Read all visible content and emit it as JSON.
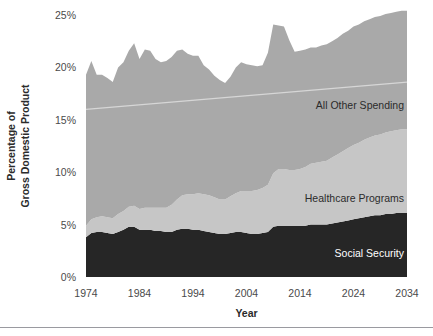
{
  "axes": {
    "y_title_line1": "Percentage of",
    "y_title_line2": "Gross Domestic Product",
    "x_title": "Year",
    "y_ticks": [
      "25%",
      "20%",
      "15%",
      "10%",
      "5%",
      "0%"
    ],
    "x_ticks": [
      "1974",
      "1984",
      "1994",
      "2004",
      "2014",
      "2024",
      "2034"
    ]
  },
  "series_labels": {
    "all_other": "All Other Spending",
    "healthcare": "Healthcare Programs",
    "social_security": "Social Security"
  },
  "colors": {
    "all_other": "#a9a9a9",
    "healthcare": "#c6c6c6",
    "social_security": "#262626",
    "average_line": "#d6d6d6",
    "label_dark": "#2b2b2b",
    "label_light": "#ffffff",
    "tick_text": "#4a4a4a",
    "rule": "#9a9aa0",
    "background": "#ffffff"
  },
  "chart_data": {
    "type": "area",
    "stacked": true,
    "title": "",
    "xlabel": "Year",
    "ylabel": "Percentage of Gross Domestic Product",
    "xlim": [
      1974,
      2034
    ],
    "ylim": [
      0,
      25
    ],
    "ytick_values": [
      0,
      5,
      10,
      15,
      20,
      25
    ],
    "xtick_values": [
      1974,
      1984,
      1994,
      2004,
      2014,
      2024,
      2034
    ],
    "grid": false,
    "legend": "inline-labels",
    "units": "percent of GDP",
    "x": [
      1974,
      1975,
      1976,
      1977,
      1978,
      1979,
      1980,
      1981,
      1982,
      1983,
      1984,
      1985,
      1986,
      1987,
      1988,
      1989,
      1990,
      1991,
      1992,
      1993,
      1994,
      1995,
      1996,
      1997,
      1998,
      1999,
      2000,
      2001,
      2002,
      2003,
      2004,
      2005,
      2006,
      2007,
      2008,
      2009,
      2010,
      2011,
      2012,
      2013,
      2014,
      2015,
      2016,
      2017,
      2018,
      2019,
      2020,
      2021,
      2022,
      2023,
      2024,
      2025,
      2026,
      2027,
      2028,
      2029,
      2030,
      2031,
      2032,
      2033,
      2034
    ],
    "series": [
      {
        "name": "Social Security",
        "color": "#262626",
        "values": [
          3.8,
          4.2,
          4.3,
          4.3,
          4.2,
          4.1,
          4.3,
          4.5,
          4.8,
          4.8,
          4.5,
          4.5,
          4.5,
          4.4,
          4.4,
          4.3,
          4.3,
          4.5,
          4.6,
          4.6,
          4.5,
          4.5,
          4.4,
          4.3,
          4.2,
          4.1,
          4.1,
          4.2,
          4.3,
          4.3,
          4.2,
          4.1,
          4.1,
          4.2,
          4.3,
          4.8,
          4.9,
          4.9,
          4.9,
          4.9,
          4.9,
          4.9,
          5.0,
          5.0,
          5.0,
          5.0,
          5.1,
          5.2,
          5.3,
          5.4,
          5.5,
          5.6,
          5.7,
          5.8,
          5.9,
          5.9,
          6.0,
          6.0,
          6.1,
          6.1,
          6.1
        ]
      },
      {
        "name": "Healthcare Programs",
        "color": "#c6c6c6",
        "values": [
          1.1,
          1.3,
          1.4,
          1.5,
          1.5,
          1.5,
          1.7,
          1.8,
          1.9,
          2.0,
          2.0,
          2.1,
          2.1,
          2.2,
          2.2,
          2.3,
          2.6,
          2.9,
          3.2,
          3.3,
          3.4,
          3.5,
          3.5,
          3.5,
          3.4,
          3.3,
          3.3,
          3.5,
          3.7,
          3.9,
          4.0,
          4.1,
          4.2,
          4.3,
          4.5,
          5.1,
          5.4,
          5.4,
          5.3,
          5.3,
          5.4,
          5.6,
          5.8,
          5.9,
          6.0,
          6.1,
          6.3,
          6.5,
          6.7,
          6.9,
          7.1,
          7.2,
          7.4,
          7.5,
          7.6,
          7.7,
          7.8,
          7.9,
          7.9,
          8.0,
          8.0
        ]
      },
      {
        "name": "All Other Spending",
        "color": "#a9a9a9",
        "values": [
          14.4,
          15.1,
          13.6,
          13.5,
          13.3,
          13.0,
          14.0,
          14.2,
          14.9,
          15.5,
          14.3,
          15.1,
          15.0,
          14.2,
          13.9,
          14.0,
          14.1,
          14.2,
          13.9,
          13.4,
          13.2,
          13.1,
          12.3,
          12.0,
          11.6,
          11.4,
          11.1,
          11.4,
          12.0,
          12.3,
          12.1,
          12.0,
          11.8,
          11.7,
          12.6,
          14.2,
          13.7,
          13.6,
          12.4,
          11.3,
          11.3,
          11.2,
          11.1,
          11.0,
          11.1,
          11.1,
          11.1,
          11.1,
          11.2,
          11.2,
          11.3,
          11.3,
          11.3,
          11.3,
          11.3,
          11.3,
          11.3,
          11.3,
          11.3,
          11.3,
          11.3
        ]
      }
    ],
    "totals": [
      19.3,
      20.6,
      19.3,
      19.3,
      19.0,
      18.6,
      20.0,
      20.5,
      21.6,
      22.3,
      20.8,
      21.7,
      21.6,
      20.8,
      20.5,
      20.6,
      21.0,
      21.6,
      21.7,
      21.3,
      21.1,
      21.1,
      20.2,
      19.8,
      19.2,
      18.8,
      18.5,
      19.1,
      20.0,
      20.5,
      20.3,
      20.2,
      20.1,
      20.2,
      21.4,
      24.1,
      24.0,
      23.9,
      22.6,
      21.5,
      21.6,
      21.7,
      21.9,
      21.9,
      22.1,
      22.2,
      22.5,
      22.8,
      23.2,
      23.5,
      23.9,
      24.1,
      24.4,
      24.6,
      24.8,
      24.9,
      25.1,
      25.2,
      25.3,
      25.4,
      25.4
    ],
    "annotations": [
      {
        "type": "reference-line",
        "label": "historical average",
        "color": "#d6d6d6",
        "from": {
          "x": 1974,
          "y": 16.0
        },
        "to": {
          "x": 2034,
          "y": 18.6
        }
      }
    ]
  }
}
